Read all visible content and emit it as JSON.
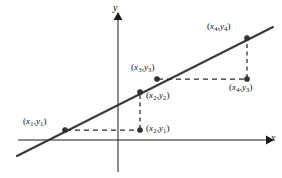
{
  "figure": {
    "background_color": "#ffffff",
    "line_color": "#3a3a3a",
    "axis_color": "#1a1a1a",
    "dash_color": "#2a2a2a",
    "point_color": "#333333"
  },
  "axes": {
    "x_label": "x",
    "y_label": "y",
    "x_axis": {
      "x1": 18,
      "y1": 140,
      "x2": 268,
      "y2": 140
    },
    "y_axis": {
      "x1": 118,
      "y1": 172,
      "x2": 118,
      "y2": 16
    }
  },
  "line": {
    "label": "line-through-points",
    "x1": 17,
    "y1": 156,
    "x2": 273,
    "y2": 27
  },
  "points": [
    {
      "id": "x1y1",
      "label_x": "x",
      "label_sub_x": "1",
      "label_y": "y",
      "label_sub_y": "1",
      "text": "(x1,y1)",
      "cx": 65,
      "cy": 130
    },
    {
      "id": "x2y1",
      "label_x": "x",
      "label_sub_x": "2",
      "label_y": "y",
      "label_sub_y": "1",
      "text": "(x2,y1)",
      "cx": 140,
      "cy": 130
    },
    {
      "id": "x2y2",
      "label_x": "x",
      "label_sub_x": "2",
      "label_y": "y",
      "label_sub_y": "2",
      "text": "(x2,y2)",
      "cx": 140,
      "cy": 92
    },
    {
      "id": "x3y3",
      "label_x": "x",
      "label_sub_x": "3",
      "label_y": "y",
      "label_sub_y": "3",
      "text": "(x3,y3)",
      "cx": 157,
      "cy": 79
    },
    {
      "id": "x4y4",
      "label_x": "x",
      "label_sub_x": "4",
      "label_y": "y",
      "label_sub_y": "4",
      "text": "(x4,y4)",
      "cx": 247,
      "cy": 38
    },
    {
      "id": "x4y3",
      "label_x": "x",
      "label_sub_x": "4",
      "label_y": "y",
      "label_sub_y": "3",
      "text": "(x4,y3)",
      "cx": 247,
      "cy": 79
    }
  ],
  "construction_lines": [
    {
      "id": "run-1",
      "kind": "horizontal-dashed",
      "x1": 65,
      "y1": 130,
      "x2": 140,
      "y2": 130
    },
    {
      "id": "rise-1",
      "kind": "vertical-dashed",
      "x1": 140,
      "y1": 130,
      "x2": 140,
      "y2": 92
    },
    {
      "id": "run-2",
      "kind": "horizontal-dashed",
      "x1": 157,
      "y1": 79,
      "x2": 247,
      "y2": 79
    },
    {
      "id": "rise-2",
      "kind": "vertical-dashed",
      "x1": 247,
      "y1": 79,
      "x2": 247,
      "y2": 38
    }
  ]
}
